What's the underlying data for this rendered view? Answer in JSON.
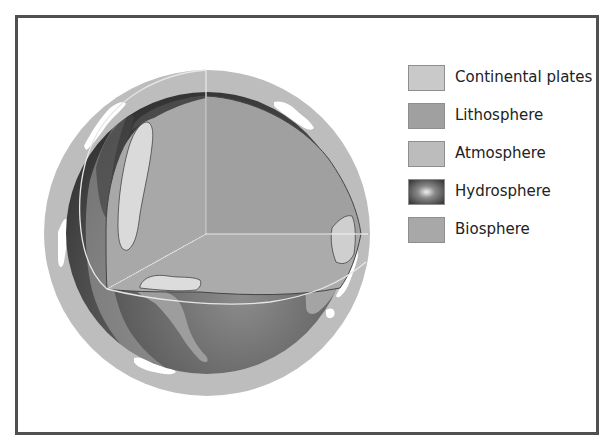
{
  "diagram": {
    "type": "earth-spheres-cutaway",
    "frame": {
      "border_color": "#505050"
    },
    "globe": {
      "center": [
        207,
        233
      ],
      "outer_radius": 163,
      "inner_radius": 140,
      "colors": {
        "atmosphere": "#bdbdbd",
        "lithosphere": "#9a9a9a",
        "hydrosphere_dark": "#3a3a3a",
        "hydrosphere_light": "#8a8a8a",
        "continental_plates": "#d8d8d8",
        "biosphere": "#a2a2a2",
        "clouds": "#ffffff",
        "cut_lines": "#e6e6e6"
      }
    }
  },
  "legend": {
    "items": [
      {
        "label": "Continental plates",
        "color": "#c9c9c9",
        "swatch": "continental-plates"
      },
      {
        "label": "Lithosphere",
        "color": "#a0a0a0",
        "swatch": "lithosphere"
      },
      {
        "label": "Atmosphere",
        "color": "#bcbcbc",
        "swatch": "atmosphere"
      },
      {
        "label": "Hydrosphere",
        "color": "#3c3c3c",
        "swatch": "hydrosphere",
        "gradient_center": "#e8e8e8"
      },
      {
        "label": "Biosphere",
        "color": "#a8a8a8",
        "swatch": "biosphere"
      }
    ]
  }
}
